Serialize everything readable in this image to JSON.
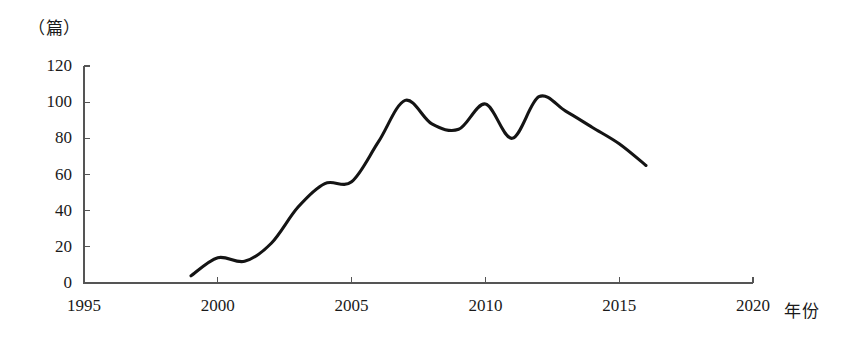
{
  "chart_data": {
    "type": "line",
    "title": "",
    "subtitle": "",
    "xlabel": "年份",
    "ylabel": "（篇）",
    "ylabel_text": "（篇）",
    "xlim": [
      1995,
      2020
    ],
    "ylim": [
      0,
      120
    ],
    "grid": false,
    "legend": null,
    "legend_position": "none",
    "x_ticks": [
      "1995",
      "2000",
      "2005",
      "2010",
      "2015",
      "2020"
    ],
    "x_tick_values": [
      1995,
      2000,
      2005,
      2010,
      2015,
      2020
    ],
    "y_ticks": [
      "0",
      "20",
      "40",
      "60",
      "80",
      "100",
      "120"
    ],
    "y_tick_values": [
      0,
      20,
      40,
      60,
      80,
      100,
      120
    ],
    "series": [
      {
        "name": "篇数",
        "color": "#141414",
        "x": [
          1999,
          2000,
          2001,
          2002,
          2003,
          2004,
          2005,
          2006,
          2007,
          2008,
          2009,
          2010,
          2011,
          2012,
          2013,
          2014,
          2015,
          2016
        ],
        "values": [
          4,
          14,
          12,
          22,
          42,
          55,
          56,
          78,
          101,
          88,
          85,
          99,
          80,
          103,
          95,
          86,
          77,
          65
        ]
      }
    ],
    "annotations": []
  },
  "axis": {
    "y_unit": "（篇）",
    "x_unit": "年份"
  }
}
